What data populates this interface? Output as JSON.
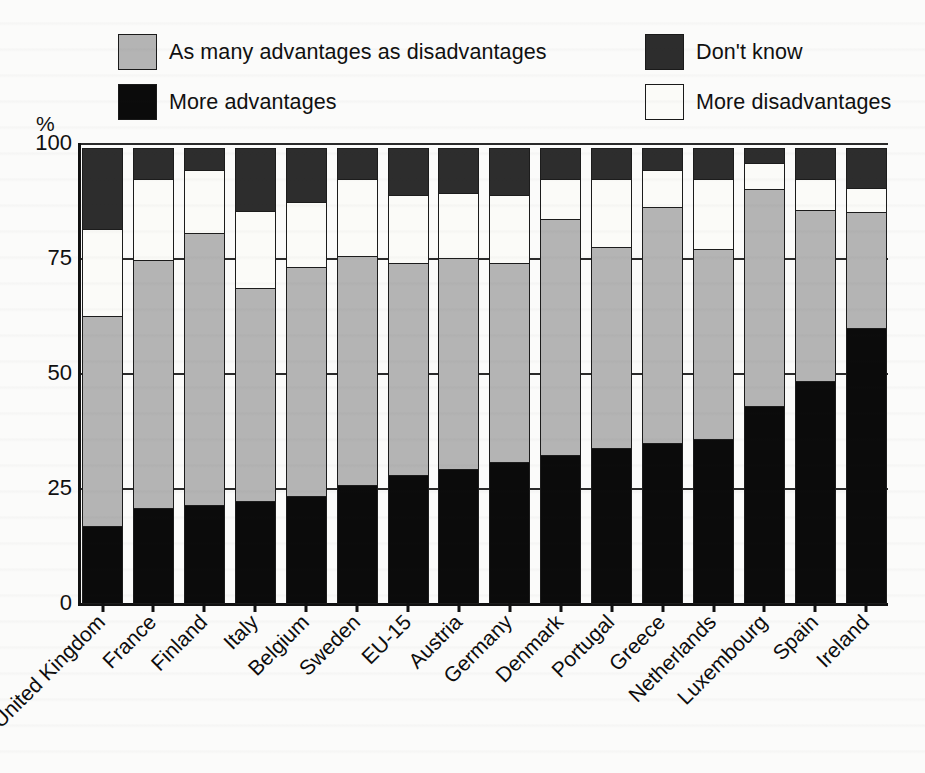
{
  "chart_data": {
    "type": "bar",
    "subtype": "stacked-bar-100",
    "title": "",
    "subtitle": "",
    "xlabel": "",
    "ylabel": "%",
    "ylim": [
      0,
      100
    ],
    "yticks": [
      100,
      75,
      50,
      25,
      0
    ],
    "grid": true,
    "legend_position": "top",
    "categories": [
      "United Kingdom",
      "France",
      "Finland",
      "Italy",
      "Belgium",
      "Sweden",
      "EU-15",
      "Austria",
      "Germany",
      "Denmark",
      "Portugal",
      "Greece",
      "Netherlands",
      "Luxembourg",
      "Spain",
      "Ireland"
    ],
    "series": [
      {
        "name": "More advantages",
        "color": "#0b0b0b",
        "values": [
          17,
          21,
          21.5,
          22.5,
          23.5,
          26,
          28,
          29.5,
          31,
          32.5,
          34,
          35,
          36,
          43,
          48.5,
          60
        ]
      },
      {
        "name": "As many advantages as disadvantages",
        "color": "#b4b4b4",
        "values": [
          46,
          54,
          59.5,
          46.5,
          50,
          50,
          46.5,
          46,
          43.5,
          51.5,
          44,
          51.5,
          41.5,
          47.5,
          37.5,
          25.5
        ]
      },
      {
        "name": "More disadvantages",
        "color": "#fbfbf8",
        "values": [
          19,
          18,
          14,
          17,
          14.5,
          17,
          15,
          14.5,
          15,
          9,
          15,
          8.5,
          15.5,
          6,
          7,
          5.5
        ]
      },
      {
        "name": "Don't know",
        "color": "#2d2d2d",
        "values": [
          18,
          7,
          5,
          14,
          12,
          7,
          10.5,
          10,
          10.5,
          7,
          7,
          5,
          7,
          3.5,
          7,
          9
        ]
      }
    ],
    "stack_tops": {
      "more_advantages": [
        17,
        21,
        21.5,
        22.5,
        23.5,
        26,
        28,
        29.5,
        31,
        32.5,
        34,
        35,
        36,
        43,
        48.5,
        60
      ],
      "as_many": [
        63,
        75,
        81,
        69,
        73.5,
        76,
        74.5,
        75.5,
        74.5,
        84,
        78,
        86.5,
        77.5,
        90.5,
        86,
        85.5
      ],
      "more_disadvantages": [
        82,
        93,
        95,
        86,
        88,
        93,
        89.5,
        90,
        89.5,
        93,
        93,
        95,
        93,
        96.5,
        93,
        91
      ],
      "dont_know": [
        100,
        100,
        100,
        100,
        100,
        100,
        100,
        100,
        100,
        100,
        100,
        100,
        100,
        100,
        100,
        100
      ]
    }
  },
  "legend": {
    "items": [
      {
        "label": "As many advantages as disadvantages",
        "color": "#b4b4b4",
        "row": 0,
        "col": 0
      },
      {
        "label": "Don't know",
        "color": "#2d2d2d",
        "row": 0,
        "col": 1
      },
      {
        "label": "More advantages",
        "color": "#0b0b0b",
        "row": 1,
        "col": 0
      },
      {
        "label": "More disadvantages",
        "color": "#fbfbf8",
        "row": 1,
        "col": 1
      }
    ]
  },
  "axis": {
    "unit_label": "%",
    "y_tick_labels": [
      "100",
      "75",
      "50",
      "25",
      "0"
    ]
  }
}
